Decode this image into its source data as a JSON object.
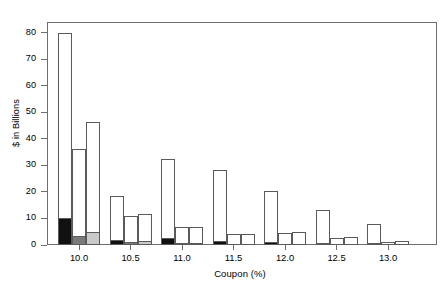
{
  "chart_data": {
    "type": "bar",
    "title": "",
    "xlabel": "Coupon (%)",
    "ylabel": "$ in Billions",
    "categories": [
      "10.0",
      "10.5",
      "11.0",
      "11.5",
      "12.0",
      "12.5",
      "13.0"
    ],
    "xtick_labels": [
      "10.0",
      "10.5",
      "11.0",
      "11.5",
      "12.0",
      "12.5",
      "13.0"
    ],
    "ytick_labels": [
      "0",
      "10",
      "20",
      "30",
      "40",
      "50",
      "60",
      "70",
      "80"
    ],
    "ytick_values": [
      0,
      10,
      20,
      30,
      40,
      50,
      60,
      70,
      80
    ],
    "ylim": [
      0,
      84
    ],
    "grid": false,
    "legend": "none",
    "stacked": true,
    "bars_per_group": 3,
    "series": [
      {
        "name": "Series 1",
        "totals": [
          80.0,
          18.3,
          32.3,
          28.2,
          20.2,
          13.3,
          8.0
        ],
        "base_values": [
          10.0,
          2.0,
          2.5,
          1.5,
          1.3,
          0.8,
          0.6
        ],
        "base_color": "#111111",
        "top_color": "#ffffff"
      },
      {
        "name": "Series 2",
        "totals": [
          36.0,
          11.0,
          6.7,
          4.3,
          4.5,
          2.7,
          1.0
        ],
        "base_values": [
          3.5,
          1.0,
          0.4,
          0.0,
          0.0,
          0.0,
          0.0
        ],
        "base_color": "#7a7a7a",
        "top_color": "#ffffff"
      },
      {
        "name": "Series 3",
        "totals": [
          46.2,
          11.8,
          6.7,
          4.0,
          5.0,
          3.0,
          1.7
        ],
        "base_values": [
          5.0,
          1.5,
          0.4,
          0.0,
          0.0,
          0.0,
          0.0
        ],
        "base_color": "#c9c9c9",
        "top_color": "#ffffff"
      }
    ],
    "axis_color": "#6e6e6e",
    "bar_outline_color": "#5a5a5a",
    "background_color": "#ffffff"
  }
}
